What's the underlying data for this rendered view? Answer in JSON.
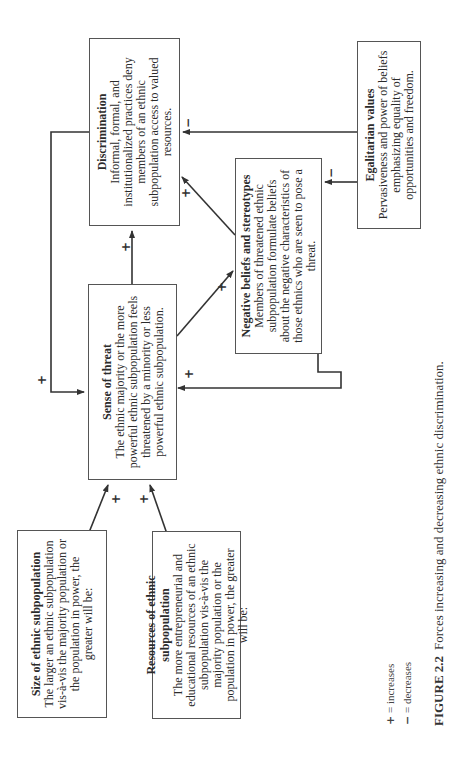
{
  "figure": {
    "orientation": "rotated 90 degrees counterclockwise",
    "boxes": {
      "discrimination": {
        "title": "Discrimination",
        "body": "Informal, formal, and institutionalized practices deny members of an ethnic subpopulation access to valued resources."
      },
      "egalitarian": {
        "title": "Egalitarian values",
        "body": "Pervasiveness and power of beliefs emphasizing equality of opportunities and freedom."
      },
      "negative_beliefs": {
        "title": "Negative beliefs and stereotypes",
        "body": "Members of threatened ethnic subpopulation formulate beliefs about the negative characteristics of those ethnics who are seen to pose a threat."
      },
      "sense_of_threat": {
        "title": "Sense of threat",
        "body": "The ethnic majority or the more powerful ethnic subpopulation feels threatened by a minority or less powerful ethnic subpopulation."
      },
      "size": {
        "title": "Size of ethnic subpopulation",
        "body": "The larger an ethnic subpopulation vis-à-vis the majority population or the population in power, the greater will be:"
      },
      "resources": {
        "title": "Resources of ethnic subpopulation",
        "body": "The more entrepreneurial and educational resources of an ethnic subpopulation vis-à-vis the majority population or the population in power, the greater will be:"
      }
    },
    "edges": [
      {
        "from": "size",
        "to": "sense_of_threat",
        "sign": "+"
      },
      {
        "from": "resources",
        "to": "sense_of_threat",
        "sign": "+"
      },
      {
        "from": "sense_of_threat",
        "to": "discrimination",
        "sign": "+"
      },
      {
        "from": "sense_of_threat",
        "to": "negative_beliefs",
        "sign": "+"
      },
      {
        "from": "negative_beliefs",
        "to": "discrimination",
        "sign": "+"
      },
      {
        "from": "negative_beliefs",
        "to": "sense_of_threat",
        "sign": "+"
      },
      {
        "from": "discrimination",
        "to": "sense_of_threat",
        "sign": "+"
      },
      {
        "from": "egalitarian",
        "to": "discrimination",
        "sign": "−"
      },
      {
        "from": "egalitarian",
        "to": "negative_beliefs",
        "sign": "−"
      }
    ],
    "signs": {
      "plus": "+",
      "minus": "−"
    },
    "legend": {
      "items": [
        {
          "symbol": "+",
          "label": "= increases"
        },
        {
          "symbol": "−",
          "label": "= decreases"
        }
      ]
    },
    "caption": {
      "label": "FIGURE 2.2",
      "text": "Forces increasing and decreasing ethnic discrimination."
    }
  }
}
